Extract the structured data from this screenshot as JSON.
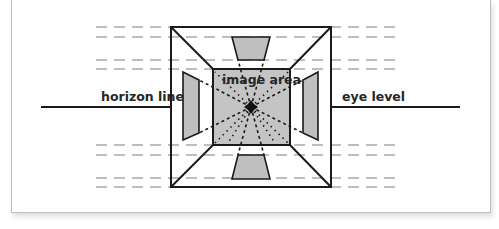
{
  "diagram": {
    "labels": {
      "horizon": "horizon line",
      "image_area": "image area",
      "eye_level": "eye level"
    },
    "colors": {
      "line": "#1a1a1a",
      "dash": "#7a7a7a",
      "panel_fill": "#bfbfbf",
      "image_area_fill": "#c4c4c4",
      "background": "#ffffff"
    },
    "dashed_rows_y": [
      27,
      37,
      60,
      69,
      145,
      155,
      178,
      187
    ]
  }
}
